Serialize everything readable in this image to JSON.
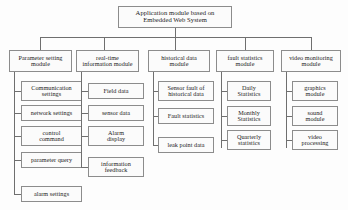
{
  "diagram": {
    "title": "Application module based on Embedded Web System",
    "root": {
      "label": "Application module based on Embedded Web System",
      "line1": "Application module based on",
      "line2": "Embedded Web System"
    },
    "columns": [
      {
        "id": "parameter-setting-module",
        "label": "Parameter setting module",
        "line1": "Parameter setting",
        "line2": "module",
        "children": [
          {
            "id": "communication-settings",
            "label": "Communication settings",
            "line1": "Communication",
            "line2": "settings"
          },
          {
            "id": "network-settings",
            "label": "network settings",
            "line1": "network settings",
            "line2": ""
          },
          {
            "id": "control-command",
            "label": "control command",
            "line1": "control",
            "line2": "command"
          },
          {
            "id": "parameter-query",
            "label": "parameter query",
            "line1": "parameter query",
            "line2": ""
          },
          {
            "id": "alarm-settings",
            "label": "alarm settings",
            "line1": "alarm settings",
            "line2": ""
          }
        ]
      },
      {
        "id": "real-time-information-module",
        "label": "real-time information module",
        "line1": "real-time",
        "line2": "information module",
        "children": [
          {
            "id": "field-data",
            "label": "Field data",
            "line1": "Field data",
            "line2": ""
          },
          {
            "id": "sensor-data",
            "label": "sensor data",
            "line1": "sensor data",
            "line2": ""
          },
          {
            "id": "alarm-display",
            "label": "Alarm display",
            "line1": "Alarm",
            "line2": "display"
          },
          {
            "id": "information-feedback",
            "label": "information feedback",
            "line1": "information",
            "line2": "feedback"
          }
        ]
      },
      {
        "id": "historical-data-module",
        "label": "historical data module",
        "line1": "historical data",
        "line2": "module",
        "children": [
          {
            "id": "sensor-fault-of-historical-data",
            "label": "Sensor fault of historical data",
            "line1": "Sensor fault of",
            "line2": "historical data"
          },
          {
            "id": "fault-statistics-item",
            "label": "Fault statistics",
            "line1": "Fault statistics",
            "line2": ""
          },
          {
            "id": "leak-point-data",
            "label": "leak point data",
            "line1": "leak point data",
            "line2": ""
          }
        ]
      },
      {
        "id": "fault-statistics-module",
        "label": "fault statistics module",
        "line1": "fault statistics",
        "line2": "module",
        "children": [
          {
            "id": "daily-statistics",
            "label": "Daily Statistics",
            "line1": "Daily",
            "line2": "Statistics"
          },
          {
            "id": "monthly-statistics",
            "label": "Monthly Statistics",
            "line1": "Monthly",
            "line2": "Statistics"
          },
          {
            "id": "quarterly-statistics",
            "label": "Quarterly statistics",
            "line1": "Quarterly",
            "line2": "statistics"
          }
        ]
      },
      {
        "id": "video-monitoring-module",
        "label": "video monitoring module",
        "line1": "video monitoring",
        "line2": "module",
        "children": [
          {
            "id": "graphics-module",
            "label": "graphics module",
            "line1": "graphics",
            "line2": "module"
          },
          {
            "id": "sound-module",
            "label": "sound module",
            "line1": "sound",
            "line2": "module"
          },
          {
            "id": "video-processing",
            "label": "video processing",
            "line1": "video",
            "line2": "processing"
          }
        ]
      }
    ],
    "colors": {
      "border": "#8c8c8c",
      "connector": "#6f6f6f",
      "background": "#fdfdfd",
      "box_fill": "#fbfbfb",
      "text": "#1a1a1a"
    }
  }
}
